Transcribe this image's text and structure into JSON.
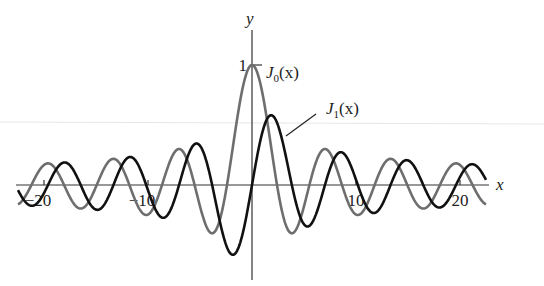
{
  "chart_data": {
    "type": "line",
    "title": "",
    "xlabel": "x",
    "ylabel": "y",
    "xlim": [
      -22.5,
      22.5
    ],
    "ylim": [
      -0.6,
      1.0
    ],
    "grid": false,
    "x_ticks": [
      -20,
      -10,
      10,
      20
    ],
    "x_tick_labels": [
      "−20",
      "−10",
      "10",
      "20"
    ],
    "y_ticks": [
      1
    ],
    "y_tick_labels": [
      "1"
    ],
    "series": [
      {
        "name": "J0(x)",
        "label_main": "J",
        "label_sub": "0",
        "label_tail": "(x)",
        "function": "bessel_j0",
        "color": "#6e6e6e",
        "x": [
          -22.5,
          -20,
          -17.5,
          -15,
          -12.5,
          -10,
          -7.5,
          -5,
          -2.5,
          0,
          2.5,
          5,
          7.5,
          10,
          12.5,
          15,
          17.5,
          20,
          22.5
        ],
        "values": [
          -0.128,
          0.167,
          -0.073,
          -0.014,
          0.147,
          -0.246,
          0.266,
          -0.178,
          -0.048,
          1.0,
          -0.048,
          -0.178,
          0.266,
          -0.246,
          0.147,
          -0.014,
          -0.073,
          0.167,
          -0.128
        ]
      },
      {
        "name": "J1(x)",
        "label_main": "J",
        "label_sub": "1",
        "label_tail": "(x)",
        "function": "bessel_j1",
        "color": "#111111",
        "x": [
          -22.5,
          -20,
          -17.5,
          -15,
          -12.5,
          -10,
          -7.5,
          -5,
          -2.5,
          0,
          2.5,
          5,
          7.5,
          10,
          12.5,
          15,
          17.5,
          20,
          22.5
        ],
        "values": [
          -0.133,
          -0.067,
          0.178,
          -0.205,
          0.166,
          -0.043,
          -0.135,
          0.328,
          -0.497,
          0.0,
          0.497,
          -0.328,
          0.135,
          0.043,
          -0.166,
          0.205,
          -0.178,
          0.067,
          0.133
        ]
      }
    ],
    "annotations": [
      {
        "text": "J0(x)",
        "near": "peak at (0, 1)"
      },
      {
        "text": "J1(x)",
        "near": "leader line to first J1 peak"
      }
    ]
  },
  "axes": {
    "x_label": "x",
    "y_label": "y"
  }
}
